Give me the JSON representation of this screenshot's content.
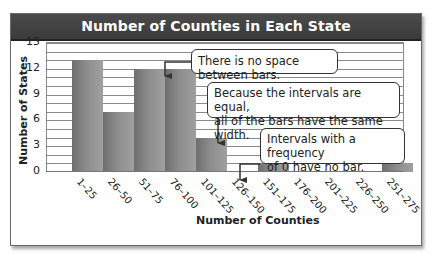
{
  "chart_data": {
    "type": "bar",
    "title": "Number of Counties in Each State",
    "xlabel": "Number of Counties",
    "ylabel": "Number of States",
    "categories": [
      "1–25",
      "26–50",
      "51–75",
      "76–100",
      "101–125",
      "126–150",
      "151–175",
      "176–200",
      "201–225",
      "226–250",
      "251–275"
    ],
    "values": [
      13,
      7,
      12,
      12,
      4,
      0,
      1,
      0,
      0,
      0,
      1
    ],
    "ylim": [
      0,
      15
    ],
    "yticks": [
      "0",
      "3",
      "6",
      "9",
      "12",
      "15"
    ],
    "grid": true,
    "grid_step": 1,
    "bar_color": "#8a8a8a",
    "annotations": [
      "There is no space between bars.",
      "Because the intervals are equal, all of the bars have the same width.",
      "Intervals with a frequency of 0 have no bar."
    ]
  },
  "callouts": {
    "no_space": "There is no space between bars.",
    "equal_line1": "Because the intervals are equal,",
    "equal_line2": "all of the bars have the same width.",
    "zero_line1": "Intervals with a frequency",
    "zero_line2": "of 0 have no bar."
  },
  "colors": {
    "titlebar": "#3f3f3f",
    "title_text": "#ffffff"
  }
}
